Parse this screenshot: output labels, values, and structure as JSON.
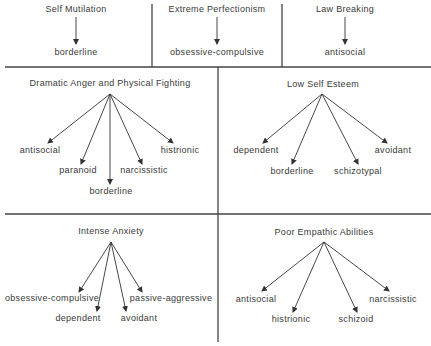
{
  "top_row": [
    {
      "title": "Self Mutilation",
      "targets": [
        "borderline"
      ]
    },
    {
      "title": "Extreme Perfectionism",
      "targets": [
        "obsessive-compulsive"
      ]
    },
    {
      "title": "Law Breaking",
      "targets": [
        "antisocial"
      ]
    }
  ],
  "middle_row": [
    {
      "title": "Dramatic Anger and Physical Fighting",
      "targets": [
        "antisocial",
        "paranoid",
        "borderline",
        "narcissistic",
        "histrionic"
      ]
    },
    {
      "title": "Low Self Esteem",
      "targets": [
        "dependent",
        "borderline",
        "schizotypal",
        "avoidant"
      ]
    }
  ],
  "bottom_row": [
    {
      "title": "Intense Anxiety",
      "targets": [
        "obsessive-compulsive",
        "dependent",
        "avoidant",
        "passive-aggressive"
      ]
    },
    {
      "title": "Poor Empathic Abilities",
      "targets": [
        "antisocial",
        "histrionic",
        "schizoid",
        "narcissistic"
      ]
    }
  ]
}
